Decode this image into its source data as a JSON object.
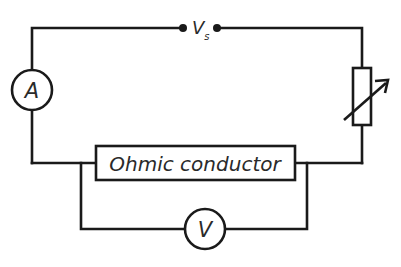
{
  "diagram": {
    "type": "circuit",
    "components": {
      "supply": {
        "symbol": "V",
        "subscript": "s",
        "description": "supply terminals"
      },
      "ammeter": {
        "label": "A"
      },
      "variable_resistor": {
        "description": "variable resistor (rheostat)"
      },
      "conductor": {
        "label": "Ohmic conductor"
      },
      "voltmeter": {
        "label": "V"
      }
    },
    "colors": {
      "line": "#1a1a1a",
      "text": "#2a2a2a",
      "background": "#ffffff"
    }
  }
}
